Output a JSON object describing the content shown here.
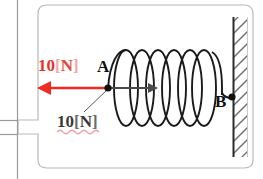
{
  "figure": {
    "type": "physics-diagram",
    "panel": {
      "background_color": "#ffffff",
      "border_color": "#b9b9b9"
    }
  },
  "labels": {
    "force": {
      "value": "10",
      "open_bracket": "[",
      "unit": "N",
      "close_bracket": "]",
      "color": "#e8332a",
      "bracket_color": "#f0a9a4"
    },
    "reading": {
      "value": "10",
      "open_bracket": "[",
      "unit": "N",
      "close_bracket": "]",
      "color": "#3a3a3a",
      "underline_color": "#f0a0a8",
      "underline_style": "wavy"
    },
    "point_a": "A",
    "point_b": "B"
  },
  "elements": {
    "spring": {
      "name": "coil-spring",
      "loops": 7,
      "color": "#1a1a1a"
    },
    "force_arrow": {
      "name": "force-arrow-left",
      "direction": "left",
      "color": "#ee2a25"
    },
    "inner_arrow": {
      "name": "inner-arrow-right",
      "direction": "right",
      "color": "#4a4a4a"
    },
    "wall": {
      "name": "fixed-wall",
      "hatch_direction": "/",
      "hatch_color": "#6e6e6e",
      "border_color": "#2b2b2b"
    },
    "anchor_dot_a": {
      "name": "anchor-dot-a",
      "color": "#111111"
    },
    "anchor_dot_b": {
      "name": "anchor-dot-b",
      "color": "#111111"
    },
    "leader_line": {
      "name": "leader-line",
      "color": "#555555"
    },
    "left_rail": {
      "name": "left-vertical-rail",
      "color": "#9a9a9a"
    }
  }
}
